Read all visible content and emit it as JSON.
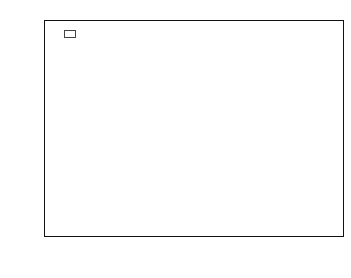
{
  "chart_data": {
    "type": "bar",
    "title": "",
    "xlabel": "(d_s, d_g)",
    "xlabel_base": "(d",
    "ylabel": "Average Broadcast Delay",
    "categories": [
      "(10,16)",
      "(10,60)",
      "(50,60)",
      "(70,90)"
    ],
    "series": [
      {
        "name": "MCB",
        "color": "#4d4d4d",
        "values": [
          140,
          440,
          1950,
          5900
        ]
      },
      {
        "name": "Improved MCB",
        "color": "#2e2e2e",
        "values": [
          72,
          270,
          1480,
          2900
        ]
      },
      {
        "name": "Random",
        "color": "#b8b8b8",
        "values": [
          58,
          230,
          1250,
          2450
        ]
      }
    ],
    "yscale": "log",
    "ylim": [
      1,
      10000
    ],
    "ytick_labels": [
      "10",
      "10",
      "10",
      "10",
      "10"
    ],
    "ytick_exponents": [
      "0",
      "1",
      "2",
      "3",
      "4"
    ],
    "ytick_values": [
      1,
      10,
      100,
      1000,
      10000
    ],
    "grid": false,
    "legend_position": "top-left"
  },
  "axis": {
    "y_title": "Average Broadcast Delay",
    "x_title_prefix": "(d",
    "x_title_sub1": "s",
    "x_title_mid": ", d",
    "x_title_sub2": "g",
    "x_title_suffix": ")"
  },
  "legend": {
    "items": [
      {
        "label": "MCB"
      },
      {
        "label": "Improved MCB"
      },
      {
        "label": "Random"
      }
    ]
  }
}
